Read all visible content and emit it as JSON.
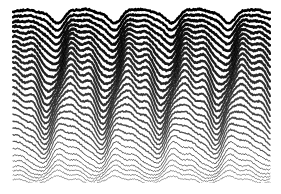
{
  "figure": {
    "title": "",
    "caption": "Stacked ridgeline wave plot",
    "width": 281,
    "height": 194,
    "background_color": "#ffffff",
    "ink_color": "#000000"
  },
  "chart_data": {
    "type": "line",
    "title": "",
    "subtitle": "",
    "xlabel": "",
    "ylabel": "",
    "grid": false,
    "legend_position": "none",
    "axis_visible": false,
    "tick_labels_x": [],
    "tick_labels_y": [],
    "xlim": [
      0,
      1
    ],
    "ylim": [
      0,
      1
    ],
    "style": "ridgeline-stacked-waves",
    "plot_area": {
      "left": 13,
      "top": 6,
      "right": 270,
      "bottom": 181
    },
    "line_count": 30,
    "line_spacing_px": 6.0,
    "stroke_color": "#000000",
    "stroke_width_top": 2.6,
    "stroke_width_bottom": 0.7,
    "opacity_top": 1.0,
    "opacity_bottom": 0.55,
    "fill_behind_lines": "#ffffff",
    "wave": {
      "cycles_across_width": 4.5,
      "base_wavelength_px": 57,
      "amplitude_top_px": 7,
      "amplitude_mid_px": 15,
      "amplitude_bottom_px": 11,
      "phase_shift_per_line_rad": 0.085,
      "harmonic2_ratio": 0.36,
      "harmonic2_phase_rad": 1.1,
      "harmonic3_ratio": 0.17,
      "harmonic3_phase_rad": 2.3,
      "envelope_centers_x": [
        0.09,
        0.3,
        0.52,
        0.74,
        0.95
      ],
      "envelope_weights": [
        0.9,
        1.0,
        0.85,
        1.0,
        0.8
      ],
      "jitter_amplitude_px": 0.9,
      "random_seed": 20240917
    },
    "series": [
      {
        "name": "trace-01",
        "y_baseline": 14,
        "amplitude": 6.5,
        "phase": 0.0,
        "weight": 2.5
      },
      {
        "name": "trace-02",
        "y_baseline": 20,
        "amplitude": 7.5,
        "phase": 0.09,
        "weight": 2.5
      },
      {
        "name": "trace-03",
        "y_baseline": 26,
        "amplitude": 8.5,
        "phase": 0.17,
        "weight": 2.6
      },
      {
        "name": "trace-04",
        "y_baseline": 32,
        "amplitude": 9.5,
        "phase": 0.26,
        "weight": 2.6
      },
      {
        "name": "trace-05",
        "y_baseline": 38,
        "amplitude": 10.5,
        "phase": 0.34,
        "weight": 2.6
      },
      {
        "name": "trace-06",
        "y_baseline": 44,
        "amplitude": 11.5,
        "phase": 0.43,
        "weight": 2.5
      },
      {
        "name": "trace-07",
        "y_baseline": 50,
        "amplitude": 12.5,
        "phase": 0.51,
        "weight": 2.5
      },
      {
        "name": "trace-08",
        "y_baseline": 56,
        "amplitude": 13.3,
        "phase": 0.6,
        "weight": 2.4
      },
      {
        "name": "trace-09",
        "y_baseline": 62,
        "amplitude": 14.0,
        "phase": 0.68,
        "weight": 2.4
      },
      {
        "name": "trace-10",
        "y_baseline": 68,
        "amplitude": 14.6,
        "phase": 0.77,
        "weight": 2.3
      },
      {
        "name": "trace-11",
        "y_baseline": 74,
        "amplitude": 15.0,
        "phase": 0.85,
        "weight": 2.3
      },
      {
        "name": "trace-12",
        "y_baseline": 80,
        "amplitude": 15.2,
        "phase": 0.94,
        "weight": 2.2
      },
      {
        "name": "trace-13",
        "y_baseline": 86,
        "amplitude": 15.3,
        "phase": 1.02,
        "weight": 2.1
      },
      {
        "name": "trace-14",
        "y_baseline": 92,
        "amplitude": 15.2,
        "phase": 1.11,
        "weight": 2.0
      },
      {
        "name": "trace-15",
        "y_baseline": 98,
        "amplitude": 15.0,
        "phase": 1.19,
        "weight": 1.9
      },
      {
        "name": "trace-16",
        "y_baseline": 104,
        "amplitude": 14.7,
        "phase": 1.28,
        "weight": 1.8
      },
      {
        "name": "trace-17",
        "y_baseline": 110,
        "amplitude": 14.3,
        "phase": 1.36,
        "weight": 1.7
      },
      {
        "name": "trace-18",
        "y_baseline": 116,
        "amplitude": 13.8,
        "phase": 1.45,
        "weight": 1.6
      },
      {
        "name": "trace-19",
        "y_baseline": 122,
        "amplitude": 13.2,
        "phase": 1.53,
        "weight": 1.5
      },
      {
        "name": "trace-20",
        "y_baseline": 128,
        "amplitude": 12.6,
        "phase": 1.62,
        "weight": 1.4
      },
      {
        "name": "trace-21",
        "y_baseline": 134,
        "amplitude": 12.0,
        "phase": 1.7,
        "weight": 1.3
      },
      {
        "name": "trace-22",
        "y_baseline": 140,
        "amplitude": 11.3,
        "phase": 1.79,
        "weight": 1.2
      },
      {
        "name": "trace-23",
        "y_baseline": 146,
        "amplitude": 10.6,
        "phase": 1.87,
        "weight": 1.1
      },
      {
        "name": "trace-24",
        "y_baseline": 152,
        "amplitude": 9.8,
        "phase": 1.96,
        "weight": 1.0
      },
      {
        "name": "trace-25",
        "y_baseline": 158,
        "amplitude": 9.0,
        "phase": 2.04,
        "weight": 0.95
      },
      {
        "name": "trace-26",
        "y_baseline": 163,
        "amplitude": 8.0,
        "phase": 2.13,
        "weight": 0.9
      },
      {
        "name": "trace-27",
        "y_baseline": 168,
        "amplitude": 7.0,
        "phase": 2.21,
        "weight": 0.85
      },
      {
        "name": "trace-28",
        "y_baseline": 172,
        "amplitude": 6.0,
        "phase": 2.3,
        "weight": 0.8
      },
      {
        "name": "trace-29",
        "y_baseline": 176,
        "amplitude": 4.8,
        "phase": 2.38,
        "weight": 0.75
      },
      {
        "name": "trace-30",
        "y_baseline": 180,
        "amplitude": 3.5,
        "phase": 2.47,
        "weight": 0.7
      }
    ]
  }
}
